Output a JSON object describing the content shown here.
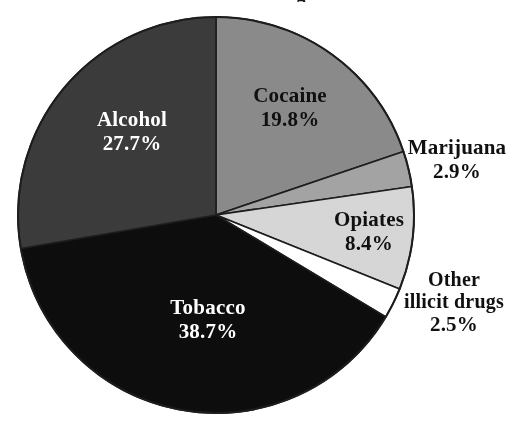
{
  "figure": {
    "title_fragment": "g",
    "background_color": "#ffffff",
    "outline_color": "#1d1d1d"
  },
  "chart_data": {
    "type": "pie",
    "title": "",
    "xlabel": "",
    "ylabel": "",
    "legend_position": "none",
    "grid": false,
    "units": "percent",
    "total": 100.0,
    "center": {
      "x": 216,
      "y": 215
    },
    "radius": 198,
    "start_angle_deg": 0,
    "direction": "clockwise",
    "categories": [
      "Cocaine",
      "Marijuana",
      "Opiates",
      "Other illicit drugs",
      "Tobacco",
      "Alcohol"
    ],
    "values": [
      19.8,
      2.9,
      8.4,
      2.5,
      38.7,
      27.7
    ],
    "slices": [
      {
        "name": "Cocaine",
        "label_line1": "Cocaine",
        "label_line2": "19.8%",
        "value": 19.8,
        "value_text": "19.8%",
        "color": "#8a8a8a",
        "text_color": "#101010",
        "label_placement": "inside"
      },
      {
        "name": "Marijuana",
        "label_line1": "Marijuana",
        "label_line2": "2.9%",
        "value": 2.9,
        "value_text": "2.9%",
        "color": "#a3a3a3",
        "text_color": "#101010",
        "label_placement": "outside"
      },
      {
        "name": "Opiates",
        "label_line1": "Opiates",
        "label_line2": "8.4%",
        "value": 8.4,
        "value_text": "8.4%",
        "color": "#d6d6d6",
        "text_color": "#101010",
        "label_placement": "inside"
      },
      {
        "name": "Other illicit drugs",
        "label_line1": "Other",
        "label_line1b": "illicit drugs",
        "label_line2": "2.5%",
        "value": 2.5,
        "value_text": "2.5%",
        "color": "#ffffff",
        "text_color": "#101010",
        "label_placement": "outside"
      },
      {
        "name": "Tobacco",
        "label_line1": "Tobacco",
        "label_line2": "38.7%",
        "value": 38.7,
        "value_text": "38.7%",
        "color": "#0d0d0d",
        "text_color": "#ffffff",
        "label_placement": "inside"
      },
      {
        "name": "Alcohol",
        "label_line1": "Alcohol",
        "label_line2": "27.7%",
        "value": 27.7,
        "value_text": "27.7%",
        "color": "#3b3b3b",
        "text_color": "#ffffff",
        "label_placement": "inside"
      }
    ]
  }
}
